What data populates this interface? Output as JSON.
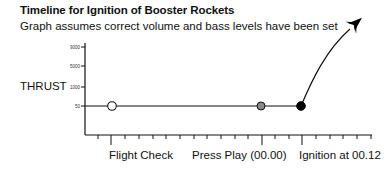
{
  "header": {
    "title": "Timeline for Ignition of Booster Rockets",
    "subtitle": "Graph assumes correct volume and bass levels have been set"
  },
  "axis": {
    "y_label": "THRUST",
    "y_ticks": [
      "9000",
      "5000",
      "1000",
      "50"
    ]
  },
  "events": [
    {
      "label": "Flight Check",
      "marker": "hollow-circle"
    },
    {
      "label": "Press Play (00.00)",
      "marker": "gray-circle"
    },
    {
      "label": "Ignition at 00.12",
      "marker": "black-circle"
    }
  ],
  "icons": {
    "rocket": "rocket-arrow-icon"
  },
  "colors": {
    "line": "#111111",
    "hollow_marker_fill": "#ffffff",
    "gray_marker_fill": "#8a8a8a",
    "black_marker_fill": "#000000"
  }
}
